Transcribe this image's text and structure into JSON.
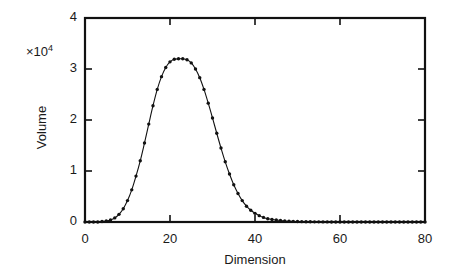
{
  "chart_data": {
    "type": "line",
    "title": "",
    "xlabel": "Dimension",
    "ylabel": "Volume",
    "y_multiplier_label": "×10",
    "y_multiplier_exponent": "4",
    "y_scale_factor": 10000,
    "xlim": [
      0,
      80
    ],
    "ylim": [
      0,
      4
    ],
    "xticks": [
      0,
      20,
      40,
      60,
      80
    ],
    "xtick_labels": [
      "0",
      "20",
      "40",
      "60",
      "80"
    ],
    "yticks": [
      0,
      1,
      2,
      3,
      4
    ],
    "ytick_labels": [
      "0",
      "1",
      "2",
      "3",
      "4"
    ],
    "grid": false,
    "legend": false,
    "marker_style": "filled-circle",
    "line_style": "solid",
    "series": [
      {
        "name": "Volume distribution",
        "x": [
          0,
          1,
          2,
          3,
          4,
          5,
          6,
          7,
          8,
          9,
          10,
          11,
          12,
          13,
          14,
          15,
          16,
          17,
          18,
          19,
          20,
          21,
          22,
          23,
          24,
          25,
          26,
          27,
          28,
          29,
          30,
          31,
          32,
          33,
          34,
          35,
          36,
          37,
          38,
          39,
          40,
          41,
          42,
          43,
          44,
          45,
          46,
          47,
          48,
          49,
          50,
          51,
          52,
          53,
          54,
          55,
          56,
          57,
          58,
          59,
          60,
          61,
          62,
          63,
          64,
          65,
          66,
          67,
          68,
          69,
          70,
          71,
          72,
          73,
          74,
          75,
          76,
          77,
          78,
          79,
          80
        ],
        "values": [
          0.0,
          0.0,
          0.0,
          0.0,
          0.01,
          0.02,
          0.04,
          0.08,
          0.15,
          0.26,
          0.42,
          0.63,
          0.9,
          1.2,
          1.55,
          1.92,
          2.28,
          2.6,
          2.85,
          3.03,
          3.14,
          3.19,
          3.2,
          3.2,
          3.18,
          3.12,
          3.0,
          2.83,
          2.6,
          2.33,
          2.04,
          1.74,
          1.45,
          1.18,
          0.94,
          0.73,
          0.56,
          0.42,
          0.31,
          0.23,
          0.17,
          0.125,
          0.09,
          0.065,
          0.05,
          0.038,
          0.028,
          0.021,
          0.016,
          0.012,
          0.009,
          0.007,
          0.005,
          0.004,
          0.003,
          0.0025,
          0.002,
          0.0015,
          0.0012,
          0.001,
          0.0008,
          0.0006,
          0.0005,
          0.0004,
          0.0003,
          0.0003,
          0.0002,
          0.0002,
          0.0001,
          0.0001,
          0.0001,
          0.0001,
          0.0,
          0.0,
          0.0,
          0.0,
          0.0,
          0.0,
          0.0,
          0.0,
          0.0
        ],
        "peak_x": 23,
        "peak_value": 3.2,
        "color": "#111111"
      }
    ]
  },
  "axes": {
    "frame_color": "#111111",
    "background": "#ffffff"
  }
}
